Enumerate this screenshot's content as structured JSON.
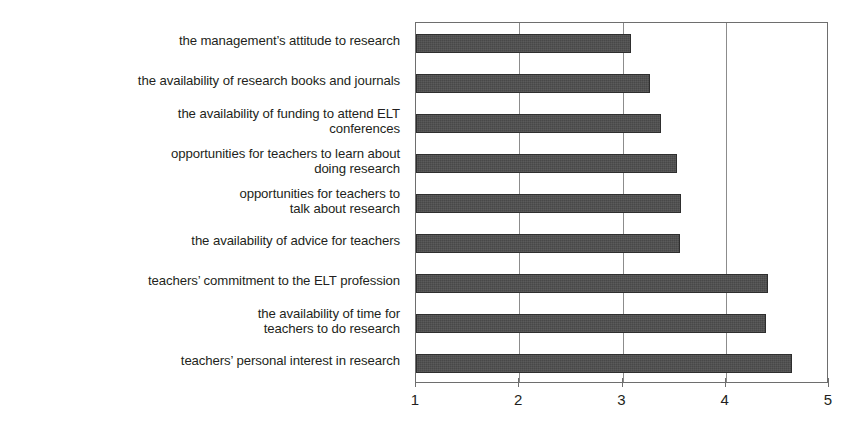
{
  "chart_data": {
    "type": "bar",
    "orientation": "horizontal",
    "title": "",
    "subtitle": "",
    "xlabel": "",
    "ylabel": "",
    "xlim": [
      1,
      5
    ],
    "xticks": [
      1,
      2,
      3,
      4
    ],
    "xticklabels": [
      "1",
      "2",
      "3",
      "4",
      "5"
    ],
    "xticks_all": [
      1,
      2,
      3,
      4,
      5
    ],
    "grid": true,
    "grid_axis": "x",
    "legend": false,
    "legend_position": "none",
    "bar_color": "#484848",
    "axis_color": "#6e6e6e",
    "text_color": "#231f20",
    "background": "#ffffff",
    "categories": [
      "the management’s attitude to research",
      "the availability of research books and journals",
      "the availability of funding to attend ELT\nconferences",
      "opportunities for teachers to learn about\ndoing research",
      "opportunities for teachers to\ntalk about research",
      "the availability of advice for teachers",
      "teachers’ commitment to the ELT profession",
      "the availability of time for\nteachers to do research",
      "teachers’ personal interest in research"
    ],
    "values": [
      3.08,
      3.27,
      3.37,
      3.53,
      3.57,
      3.56,
      4.41,
      4.39,
      4.64
    ]
  },
  "axis": {
    "tick_1": "1",
    "tick_2": "2",
    "tick_3": "3",
    "tick_4": "4",
    "tick_5": "5"
  }
}
